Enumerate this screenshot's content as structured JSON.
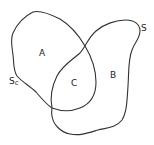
{
  "diagram": {
    "type": "set-overlap",
    "regions": [
      {
        "id": "A",
        "label": "A",
        "x": 42,
        "y": 56
      },
      {
        "id": "B",
        "label": "B",
        "x": 113,
        "y": 78
      },
      {
        "id": "C",
        "label": "C",
        "x": 74,
        "y": 86
      }
    ],
    "boundaries": [
      {
        "id": "Sc",
        "label_main": "S",
        "label_sub": "c",
        "x": 11,
        "y": 83
      },
      {
        "id": "S",
        "label_main": "S",
        "label_sub": "",
        "x": 142,
        "y": 31
      }
    ],
    "colors": {
      "stroke": "#333333",
      "text": "#222222",
      "background": "#ffffff"
    }
  }
}
